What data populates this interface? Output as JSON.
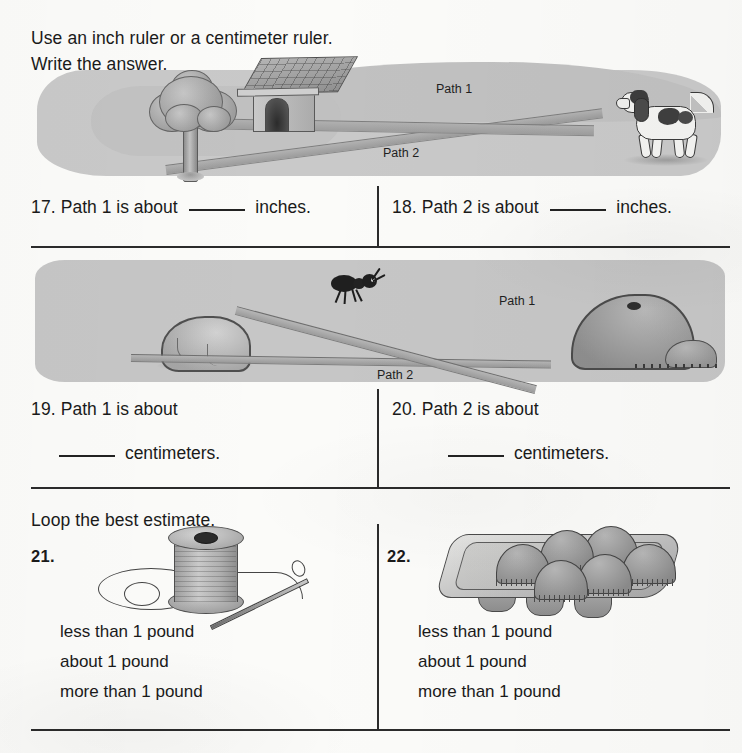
{
  "instructions": {
    "line1": "Use an inch ruler or a centimeter ruler.",
    "line2": "Write the answer.",
    "line3": "Loop the best estimate."
  },
  "illustration_1": {
    "name": "dog-doghouse-tree-scene",
    "objects": [
      "tree",
      "doghouse",
      "dog"
    ],
    "path_label_1": "Path 1",
    "path_label_2": "Path 2"
  },
  "illustration_2": {
    "name": "ant-rock-anthill-scene",
    "objects": [
      "rock",
      "ant",
      "anthill"
    ],
    "path_label_1": "Path 1",
    "path_label_2": "Path 2"
  },
  "illustration_3": {
    "name": "spool-of-thread-with-needle"
  },
  "illustration_4": {
    "name": "muffin-tin-with-six-muffins"
  },
  "questions": [
    {
      "number": "17.",
      "prefix": "Path 1 is about",
      "suffix": "inches.",
      "blank_position": "middle"
    },
    {
      "number": "18.",
      "prefix": "Path 2 is about",
      "suffix": "inches.",
      "blank_position": "middle"
    },
    {
      "number": "19.",
      "prefix": "Path 1 is about",
      "suffix": "centimeters.",
      "blank_position": "next-line"
    },
    {
      "number": "20.",
      "prefix": "Path 2 is about",
      "suffix": "centimeters.",
      "blank_position": "next-line"
    }
  ],
  "estimate_items": [
    {
      "number": "21.",
      "choices": [
        "less than 1 pound",
        "about 1 pound",
        "more than 1 pound"
      ]
    },
    {
      "number": "22.",
      "choices": [
        "less than 1 pound",
        "about 1 pound",
        "more than 1 pound"
      ]
    }
  ],
  "colors": {
    "paper": "#fbfbf9",
    "ink": "#1a1a1a",
    "rule": "#2b2b2b",
    "illustration_ground": "#c6c6c6",
    "path_fill": "#a8a8a8"
  }
}
